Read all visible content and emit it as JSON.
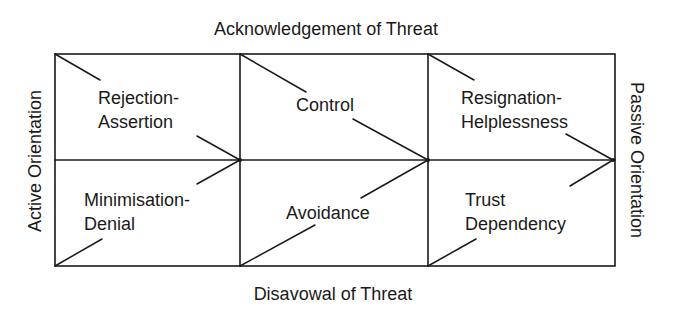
{
  "axes": {
    "top": "Acknowledgement of Threat",
    "bottom": "Disavowal of Threat",
    "left": "Active Orientation",
    "right": "Passive Orientation"
  },
  "grid": {
    "columns": [
      55,
      240,
      428,
      615
    ],
    "rows": [
      54,
      160,
      266
    ],
    "stroke_color": "#1a1a1a"
  },
  "cells": [
    {
      "row": "top",
      "column": "active",
      "lines": [
        "Rejection-",
        "Assertion"
      ]
    },
    {
      "row": "top",
      "column": "middle",
      "lines": [
        "Control"
      ]
    },
    {
      "row": "top",
      "column": "passive",
      "lines": [
        "Resignation-",
        "Helplessness"
      ]
    },
    {
      "row": "bottom",
      "column": "active",
      "lines": [
        "Minimisation-",
        "Denial"
      ]
    },
    {
      "row": "bottom",
      "column": "middle",
      "lines": [
        "Avoidance"
      ]
    },
    {
      "row": "bottom",
      "column": "passive",
      "lines": [
        "Trust",
        "Dependency"
      ]
    }
  ]
}
